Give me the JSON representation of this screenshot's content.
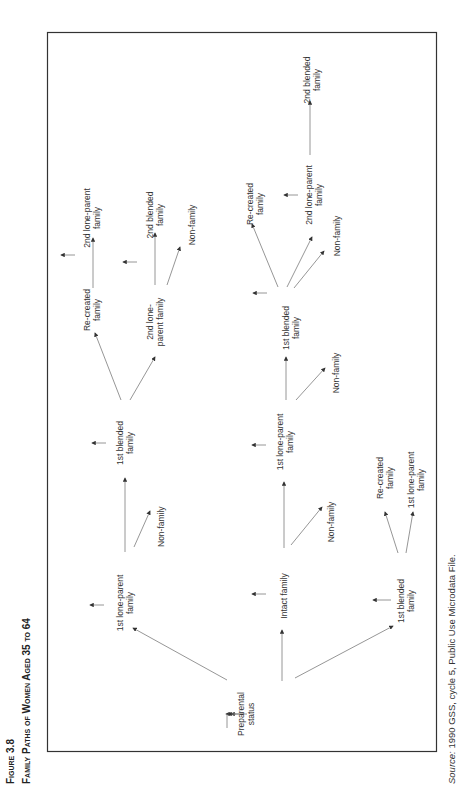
{
  "figure": {
    "number_label": "Figure 3.8",
    "title": "Family Paths of Women Aged 35 to 64"
  },
  "source": {
    "prefix": "Source:",
    "text": " 1990 GSS, cycle 5, Public Use Microdata File."
  },
  "nodes": {
    "preparental": [
      "Preparental",
      "status"
    ],
    "lp1_a": [
      "1st lone-parent",
      "family"
    ],
    "intact": [
      "Intact family"
    ],
    "bl1_a": [
      "1st blended",
      "family"
    ],
    "bl1_b": [
      "1st blended",
      "family"
    ],
    "nf_a": [
      "Non-family"
    ],
    "lp1_b": [
      "1st lone-parent",
      "family"
    ],
    "nf_b": [
      "Non-family"
    ],
    "rc_a": [
      "Re-created",
      "family"
    ],
    "lp1_c": [
      "1st lone-parent",
      "family"
    ],
    "rc_b": [
      "Re-created",
      "family"
    ],
    "lp2_a": [
      "2nd lone-",
      "parent family"
    ],
    "lp2_b": [
      "2nd lone-parent",
      "family"
    ],
    "bl2_a": [
      "2nd blended",
      "family"
    ],
    "nf_c": [
      "Non-family"
    ],
    "bl1_c": [
      "1st blended",
      "family"
    ],
    "nf_d": [
      "Non-family"
    ],
    "rc_c": [
      "Re-created",
      "family"
    ],
    "lp2_c": [
      "2nd lone-parent",
      "family"
    ],
    "nf_e": [
      "Non-family"
    ],
    "bl2_b": [
      "2nd blended",
      "family"
    ]
  },
  "edges": [
    [
      "preparental",
      "lp1_a"
    ],
    [
      "preparental",
      "intact"
    ],
    [
      "preparental",
      "bl1_a"
    ],
    [
      "lp1_a",
      "bl1_b"
    ],
    [
      "lp1_a",
      "nf_a"
    ],
    [
      "bl1_b",
      "rc_b"
    ],
    [
      "bl1_b",
      "lp2_a"
    ],
    [
      "rc_b",
      "lp2_b"
    ],
    [
      "lp2_a",
      "bl2_a"
    ],
    [
      "lp2_a",
      "nf_c"
    ],
    [
      "intact",
      "lp1_b"
    ],
    [
      "intact",
      "nf_b"
    ],
    [
      "lp1_b",
      "bl1_c"
    ],
    [
      "lp1_b",
      "nf_d"
    ],
    [
      "bl1_c",
      "rc_c"
    ],
    [
      "bl1_c",
      "lp2_c"
    ],
    [
      "bl1_c",
      "nf_e"
    ],
    [
      "lp2_c",
      "bl2_b"
    ],
    [
      "bl1_a",
      "rc_a"
    ],
    [
      "bl1_a",
      "lp1_c"
    ]
  ],
  "colors": {
    "line": "#8a8a8a",
    "text": "#333333",
    "frame": "#333333"
  }
}
